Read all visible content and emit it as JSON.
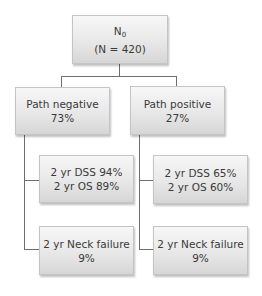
{
  "root": {
    "title_main": "N",
    "title_sub": "0",
    "count": "(N = 420)"
  },
  "branches": [
    {
      "label": "Path negative",
      "percent": "73%",
      "children": [
        {
          "line1": "2 yr DSS 94%",
          "line2": "2 yr OS 89%"
        },
        {
          "line1": "2 yr Neck failure",
          "line2": "9%"
        }
      ]
    },
    {
      "label": "Path positive",
      "percent": "27%",
      "children": [
        {
          "line1": "2 yr DSS 65%",
          "line2": "2 yr OS 60%"
        },
        {
          "line1": "2 yr Neck failure",
          "line2": "9%"
        }
      ]
    }
  ]
}
